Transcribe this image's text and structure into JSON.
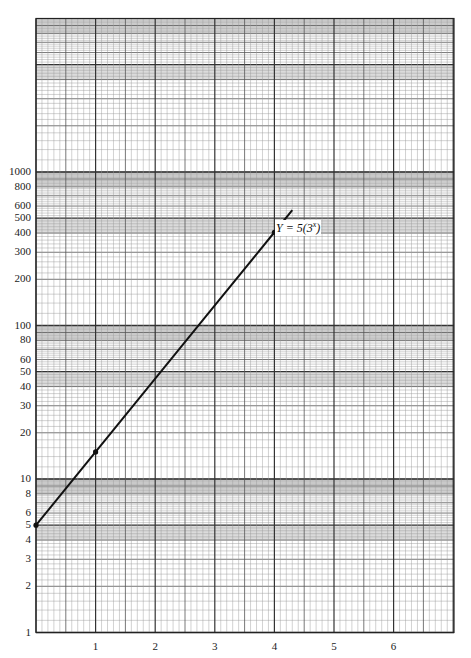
{
  "chart_data": {
    "type": "line",
    "title": "",
    "xlabel": "",
    "ylabel": "",
    "yscale": "log",
    "xlim": [
      0,
      7
    ],
    "ylim": [
      1,
      10000
    ],
    "grid": true,
    "paper": "semi-log graph paper, 4 cycles",
    "x_ticks": [
      1,
      2,
      3,
      4,
      5,
      6
    ],
    "x_tick_labels": [
      "1",
      "2",
      "3",
      "4",
      "5",
      "6"
    ],
    "y_ticks": [
      1,
      2,
      3,
      4,
      5,
      6,
      8,
      10,
      20,
      30,
      40,
      50,
      60,
      80,
      100,
      200,
      300,
      400,
      500,
      600,
      800,
      1000
    ],
    "y_tick_labels": [
      "1",
      "2",
      "3",
      "4",
      "5",
      "6",
      "8",
      "10",
      "20",
      "30",
      "40",
      "50",
      "60",
      "80",
      "100",
      "200",
      "300",
      "400",
      "500",
      "600",
      "800",
      "1000"
    ],
    "series": [
      {
        "name": "Y = 5(3^x)",
        "equation": "Y = 5(3^x)",
        "x": [
          0,
          1,
          2,
          3,
          4,
          4.3
        ],
        "values": [
          5,
          15,
          45,
          135,
          405,
          564.6
        ],
        "marked_points": [
          [
            0,
            5
          ],
          [
            1,
            15
          ],
          [
            4,
            405
          ]
        ],
        "color": "#111111"
      }
    ],
    "annotations": [
      {
        "text": "Y = 5(3",
        "superscript": "x",
        "suffix": ")",
        "x": 4.05,
        "y": 300
      }
    ]
  },
  "labels": {
    "equation_main": "Y = 5(3",
    "equation_sup": "x",
    "equation_close": ")"
  },
  "colors": {
    "grid_minor": "#9a9a9a",
    "grid_major": "#333333",
    "band": "#cfcfcf",
    "line": "#111111"
  }
}
